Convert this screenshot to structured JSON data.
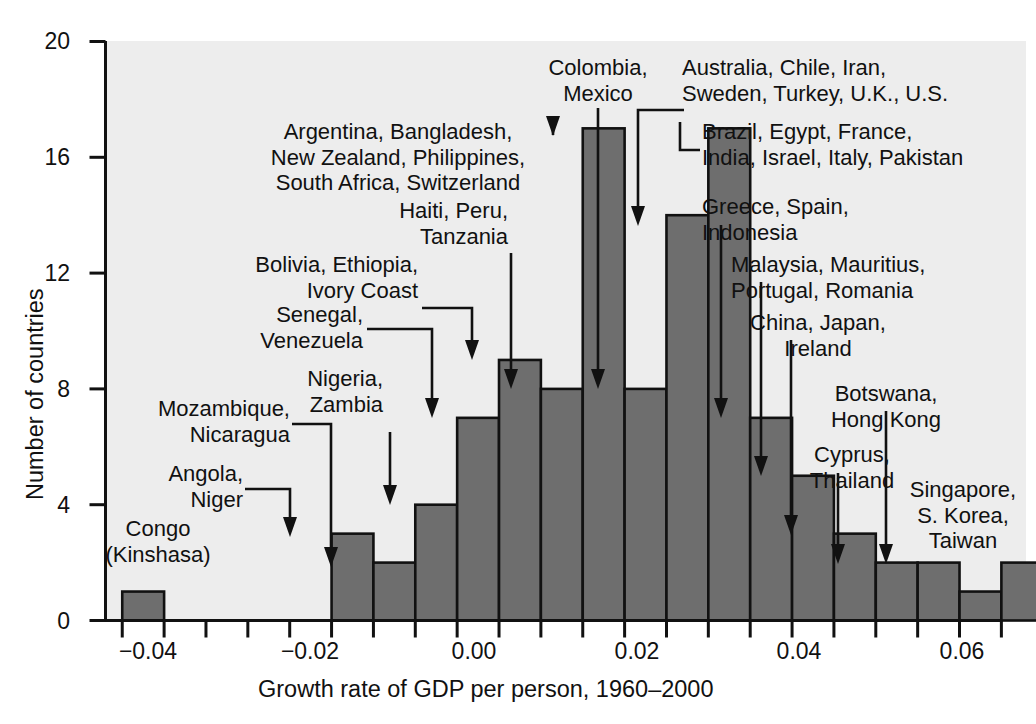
{
  "chart_data": {
    "type": "bar",
    "title": "",
    "xlabel": "Growth rate of GDP per person, 1960–2000",
    "ylabel": "Number of countries",
    "ylim": [
      0,
      20
    ],
    "xlim": [
      -0.0445,
      0.0655
    ],
    "grid": false,
    "legend": "none",
    "bin_width": 0.005,
    "y_ticks": [
      "0",
      "4",
      "8",
      "12",
      "16",
      "20"
    ],
    "y_tick_values": [
      0,
      4,
      8,
      12,
      16,
      20
    ],
    "x_ticks": [
      "−0.04",
      "−0.02",
      "0.00",
      "0.02",
      "0.04",
      "0.06"
    ],
    "x_tick_values": [
      -0.04,
      -0.02,
      0.0,
      0.02,
      0.04,
      0.06
    ],
    "x_minor_tick_step": 0.005,
    "categories": [
      "-0.0425",
      "-0.0375",
      "-0.0325",
      "-0.0275",
      "-0.0225",
      "-0.0175",
      "-0.0125",
      "-0.0075",
      "-0.0025",
      "0.0025",
      "0.0075",
      "0.0125",
      "0.0175",
      "0.0225",
      "0.0275",
      "0.0325",
      "0.0375",
      "0.0425",
      "0.0475",
      "0.0525",
      "0.0575",
      "0.0625"
    ],
    "bin_starts": [
      -0.0425,
      -0.0375,
      -0.0325,
      -0.0275,
      -0.0225,
      -0.0175,
      -0.0125,
      -0.0075,
      -0.0025,
      0.0025,
      0.0075,
      0.0125,
      0.0175,
      0.0225,
      0.0275,
      0.0325,
      0.0375,
      0.0425,
      0.0475,
      0.0525,
      0.0575,
      0.0625
    ],
    "values": [
      1,
      0,
      0,
      0,
      0,
      3,
      2,
      4,
      7,
      9,
      8,
      17,
      8,
      14,
      17,
      7,
      5,
      3,
      2,
      2,
      1,
      2
    ],
    "colors": {
      "bar_fill": "#6e6e6e",
      "bar_stroke": "#111111",
      "plot_background": "#ededed",
      "page_background": "#ffffff",
      "axis": "#111111",
      "text": "#111111"
    }
  },
  "annotations": [
    {
      "id": "congo",
      "lines": [
        "Congo",
        "(Kinshasa)"
      ]
    },
    {
      "id": "angola",
      "lines": [
        "Angola,",
        "Niger"
      ]
    },
    {
      "id": "mozambique",
      "lines": [
        "Mozambique,",
        "Nicaragua"
      ]
    },
    {
      "id": "nigeria",
      "lines": [
        "Nigeria,",
        "Zambia"
      ]
    },
    {
      "id": "senegal",
      "lines": [
        "Senegal,",
        "Venezuela"
      ]
    },
    {
      "id": "bolivia",
      "lines": [
        "Bolivia, Ethiopia,",
        "Ivory Coast"
      ]
    },
    {
      "id": "haiti",
      "lines": [
        "Haiti, Peru,",
        "Tanzania"
      ]
    },
    {
      "id": "argentina",
      "lines": [
        "Argentina, Bangladesh,",
        "New Zealand, Philippines,",
        "South Africa, Switzerland"
      ]
    },
    {
      "id": "colombia",
      "lines": [
        "Colombia,",
        "Mexico"
      ]
    },
    {
      "id": "australia",
      "lines": [
        "Australia, Chile, Iran,",
        "Sweden, Turkey, U.K., U.S."
      ]
    },
    {
      "id": "brazil",
      "lines": [
        "Brazil, Egypt, France,",
        "India, Israel, Italy, Pakistan"
      ]
    },
    {
      "id": "greece",
      "lines": [
        "Greece, Spain,",
        "Indonesia"
      ]
    },
    {
      "id": "malaysia",
      "lines": [
        "Malaysia, Mauritius,",
        "Portugal, Romania"
      ]
    },
    {
      "id": "china",
      "lines": [
        "China, Japan,",
        "Ireland"
      ]
    },
    {
      "id": "botswana",
      "lines": [
        "Botswana,",
        "Hong Kong"
      ]
    },
    {
      "id": "cyprus",
      "lines": [
        "Cyprus,",
        "Thailand"
      ]
    },
    {
      "id": "singapore",
      "lines": [
        "Singapore,",
        "S. Korea,",
        "Taiwan"
      ]
    }
  ],
  "axis_labels": {
    "x_title": "Growth rate of GDP per person, 1960–2000",
    "y_title": "Number of countries"
  }
}
